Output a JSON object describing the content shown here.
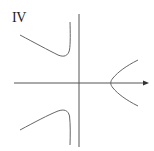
{
  "figure": {
    "label": "IV",
    "colors": {
      "background": "#ffffff",
      "axes": "#555555",
      "curve": "#666666",
      "text": "#222222"
    },
    "axes": {
      "x_axis": {
        "has_arrow": true
      },
      "y_axis": {
        "has_arrow": false
      }
    },
    "curves": [
      {
        "name": "upper-left-branch",
        "description": "decreasing from left, minimum near y-axis, rising steeply toward vertical asymptote"
      },
      {
        "name": "lower-left-branch",
        "description": "increasing from left, maximum near y-axis, falling steeply toward vertical asymptote"
      },
      {
        "name": "right-branch",
        "description": "sideways parabola-like branch opening right with vertex on x-axis"
      }
    ]
  }
}
